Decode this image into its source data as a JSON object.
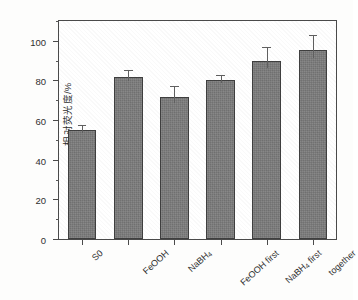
{
  "chart_data": {
    "type": "bar",
    "title": "",
    "xlabel": "",
    "ylabel": "相对荧光度/%",
    "ylim": [
      0,
      110
    ],
    "yticks": [
      0,
      20,
      40,
      60,
      80,
      100
    ],
    "ytick_labels": [
      "0",
      "20",
      "40",
      "60",
      "80",
      "100"
    ],
    "yminor_ticks": [
      10,
      30,
      50,
      70,
      90,
      110
    ],
    "grid": false,
    "legend": null,
    "bar_color": "#7c7c7c",
    "bar_edge_color": "#3f3f3f",
    "error_bar_color": "#606060",
    "axis_color": "#4a4a4a",
    "categories": [
      "S0",
      "FeOOH",
      "NaBH4",
      "FeOOH first",
      "NaBH4 first",
      "together"
    ],
    "category_labels_html": [
      "S0",
      "FeOOH",
      "NaBH<sub>4</sub>",
      "FeOOH first",
      "NaBH<sub>4</sub> first",
      "together"
    ],
    "values": [
      54.8,
      81.5,
      71.5,
      80.2,
      90.0,
      95.3
    ],
    "errors": [
      2.8,
      3.6,
      5.5,
      2.4,
      7.0,
      7.6
    ]
  }
}
